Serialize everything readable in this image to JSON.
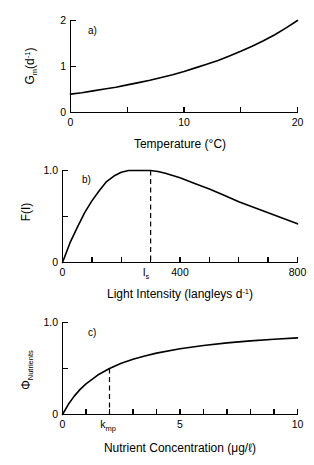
{
  "figure": {
    "title": "",
    "panels": [
      "a",
      "b",
      "c"
    ]
  },
  "chart_data": [
    {
      "type": "line",
      "panel": "a",
      "panel_label": "a)",
      "title": "",
      "xlabel": "Temperature  (°C)",
      "ylabel": "G_m (d^-1)",
      "ylabel_parts": {
        "base": "G",
        "subscript": "m",
        "unit_open": "(d",
        "unit_sup": "-1",
        "unit_close": ")"
      },
      "xlim": [
        0,
        20
      ],
      "ylim": [
        0,
        2
      ],
      "xticks": [
        0,
        5,
        10,
        15,
        20
      ],
      "xticklabels": [
        "0",
        "",
        "10",
        "",
        "20"
      ],
      "yticks": [
        0,
        1,
        2
      ],
      "yticklabels": [
        "0",
        "1",
        "2"
      ],
      "grid": false,
      "legend": "none",
      "equation": "Gm = 0.4 * exp(0.0805 * T)",
      "x": [
        0,
        1,
        2,
        3,
        4,
        5,
        6,
        7,
        8,
        9,
        10,
        11,
        12,
        13,
        14,
        15,
        16,
        17,
        18,
        19,
        20
      ],
      "values": [
        0.4,
        0.43,
        0.47,
        0.51,
        0.55,
        0.6,
        0.65,
        0.7,
        0.76,
        0.82,
        0.89,
        0.97,
        1.05,
        1.13,
        1.23,
        1.33,
        1.44,
        1.56,
        1.69,
        1.84,
        2.0
      ]
    },
    {
      "type": "line",
      "panel": "b",
      "panel_label": "b)",
      "title": "",
      "xlabel": "Light Intensity  (langleys d^-1)",
      "xlabel_parts": {
        "main": "Light Intensity  (langleys d",
        "sup": "-1",
        "close": ")"
      },
      "ylabel": "F(I)",
      "xlim": [
        0,
        800
      ],
      "ylim": [
        0,
        1.0
      ],
      "xticks": [
        0,
        100,
        200,
        300,
        400,
        500,
        600,
        700,
        800
      ],
      "xticklabels": [
        "0",
        "",
        "",
        "",
        "400",
        "",
        "",
        "",
        "800"
      ],
      "yticks": [
        0,
        0.5,
        1.0
      ],
      "yticklabels": [
        "0",
        "",
        "1.0"
      ],
      "annotations": [
        {
          "name": "Is",
          "label": "I_s",
          "x": 300,
          "y": 1.0,
          "type": "vertical-dashed-marker"
        }
      ],
      "grid": false,
      "legend": "none",
      "equation": "F(I) = (I/Is) * exp(1 - I/Is), Is = 300",
      "x": [
        0,
        25,
        50,
        75,
        100,
        125,
        150,
        175,
        200,
        225,
        250,
        275,
        300,
        325,
        350,
        400,
        450,
        500,
        550,
        600,
        650,
        700,
        750,
        800
      ],
      "values": [
        0.0,
        0.21,
        0.38,
        0.54,
        0.67,
        0.78,
        0.88,
        0.94,
        0.98,
        1.0,
        1.0,
        1.0,
        1.0,
        0.99,
        0.97,
        0.92,
        0.86,
        0.8,
        0.73,
        0.66,
        0.6,
        0.54,
        0.48,
        0.42
      ]
    },
    {
      "type": "line",
      "panel": "c",
      "panel_label": "c)",
      "title": "",
      "xlabel": "Nutrient Concentration  (μg/ℓ)",
      "ylabel": "Φ_Nutrients",
      "ylabel_parts": {
        "base": "Φ",
        "subscript": "Nutrients"
      },
      "xlim": [
        0,
        10
      ],
      "ylim": [
        0,
        1.0
      ],
      "xticks": [
        0,
        1,
        2,
        3,
        4,
        5,
        6,
        7,
        8,
        9,
        10
      ],
      "xticklabels": [
        "0",
        "",
        "",
        "",
        "",
        "5",
        "",
        "",
        "",
        "",
        "10"
      ],
      "yticks": [
        0,
        0.5,
        1.0
      ],
      "yticklabels": [
        "0",
        "",
        "1.0"
      ],
      "annotations": [
        {
          "name": "kmp",
          "label": "k_mp",
          "x": 2,
          "y": 0.5,
          "type": "vertical-dashed-marker"
        }
      ],
      "grid": false,
      "legend": "none",
      "equation": "Phi = N / (N + kmp), kmp = 2",
      "x": [
        0,
        0.25,
        0.5,
        0.75,
        1,
        1.5,
        2,
        2.5,
        3,
        3.5,
        4,
        5,
        6,
        7,
        8,
        9,
        10
      ],
      "values": [
        0.0,
        0.111,
        0.2,
        0.273,
        0.333,
        0.429,
        0.5,
        0.556,
        0.6,
        0.636,
        0.667,
        0.714,
        0.75,
        0.778,
        0.8,
        0.818,
        0.833
      ]
    }
  ],
  "labels": {
    "panel_a_tag": "a)",
    "panel_b_tag": "b)",
    "panel_c_tag": "c)",
    "a_ylabel_base": "G",
    "a_ylabel_sub": "m",
    "a_ylabel_unit_open": "(d",
    "a_ylabel_unit_sup": "-1",
    "a_ylabel_unit_close": ")",
    "a_xlabel": "Temperature  (°C)",
    "a_xtick_0": "0",
    "a_xtick_10": "10",
    "a_xtick_20": "20",
    "a_ytick_0": "0",
    "a_ytick_1": "1",
    "a_ytick_2": "2",
    "b_ylabel": "F(I)",
    "b_xlabel_main": "Light Intensity  (langleys d",
    "b_xlabel_sup": "-1",
    "b_xlabel_close": ")",
    "b_xtick_0": "0",
    "b_xtick_400": "400",
    "b_xtick_800": "800",
    "b_ytick_0": "0",
    "b_ytick_1": "1.0",
    "b_is_base": "I",
    "b_is_sub": "s",
    "c_ylabel_base": "Φ",
    "c_ylabel_sub": "Nutrients",
    "c_xlabel": "Nutrient Concentration  (μg/ℓ)",
    "c_xtick_0": "0",
    "c_xtick_5": "5",
    "c_xtick_10": "10",
    "c_ytick_0": "0",
    "c_ytick_1": "1.0",
    "c_kmp_base": "k",
    "c_kmp_sub": "mp"
  },
  "colors": {
    "background": "#ffffff",
    "ink": "#000000",
    "curve": "#000000"
  }
}
